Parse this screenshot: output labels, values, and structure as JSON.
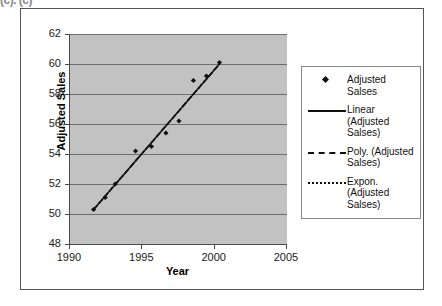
{
  "clipped_top_text": "(c). (c)",
  "chart_data": {
    "type": "scatter",
    "title": "",
    "xlabel": "Year",
    "ylabel": "Adjusted Sales",
    "xlim": [
      1990,
      2005
    ],
    "ylim": [
      48,
      62
    ],
    "xticks": [
      1990,
      1995,
      2000,
      2005
    ],
    "yticks": [
      48,
      50,
      52,
      54,
      56,
      58,
      60,
      62
    ],
    "grid": "horizontal",
    "plot_background": "#c2c2c2",
    "marker_color": "#111111",
    "series": [
      {
        "name": "Adjusted Salses",
        "marker": "diamond",
        "x": [
          1991.7,
          1992.5,
          1993.2,
          1994.6,
          1995.7,
          1996.7,
          1997.6,
          1998.6,
          1999.5,
          2000.4
        ],
        "y": [
          50.3,
          51.1,
          52.0,
          54.2,
          54.5,
          55.4,
          56.2,
          58.9,
          59.2,
          60.1
        ]
      }
    ],
    "trendlines": [
      {
        "name": "Linear (Adjusted Salses)",
        "style": "solid",
        "x": [
          1991.7,
          2000.4
        ],
        "y": [
          50.3,
          60.0
        ]
      },
      {
        "name": "Poly. (Adjusted Salses)",
        "style": "dashed",
        "x": [
          1991.7,
          2000.4
        ],
        "y": [
          50.3,
          60.0
        ]
      },
      {
        "name": "Expon. (Adjusted Salses)",
        "style": "dotted",
        "x": [
          1991.7,
          2000.4
        ],
        "y": [
          50.3,
          60.0
        ]
      }
    ],
    "legend_position": "right",
    "legend_entries": [
      {
        "label": "Adjusted Salses",
        "key": "diamond-marker"
      },
      {
        "label": "Linear (Adjusted Salses)",
        "key": "solid-line"
      },
      {
        "label": "Poly. (Adjusted Salses)",
        "key": "dashed-line"
      },
      {
        "label": "Expon. (Adjusted Salses)",
        "key": "dotted-line"
      }
    ]
  }
}
